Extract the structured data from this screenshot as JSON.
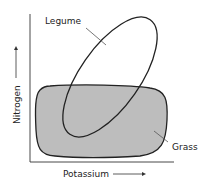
{
  "diagram": {
    "x_axis_label": "Potassium",
    "y_axis_label": "Nitrogen",
    "regions": [
      {
        "name": "Legume",
        "fill": "none",
        "stroke": "#222222"
      },
      {
        "name": "Grass",
        "fill": "#bdbdbd",
        "stroke": "#222222"
      }
    ],
    "labels": {
      "legume": "Legume",
      "grass": "Grass"
    }
  }
}
